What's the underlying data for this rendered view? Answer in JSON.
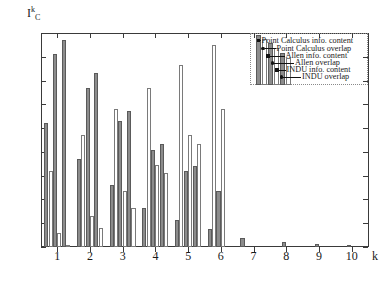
{
  "chart_data": {
    "type": "bar",
    "title": "",
    "subtitle": "",
    "xlabel": "k",
    "ylabel": "I",
    "ylabel_sup": "k",
    "ylabel_sub": "C",
    "categories": [
      "1",
      "2",
      "3",
      "4",
      "5",
      "6",
      "7",
      "8",
      "9",
      "10"
    ],
    "xlim": [
      0.5,
      10.5
    ],
    "ylim": [
      0,
      0.9
    ],
    "yticks": [
      "0",
      "0.1",
      "0.2",
      "0.3",
      "0.4",
      "0.5",
      "0.6",
      "0.7",
      "0.8",
      "0.9"
    ],
    "ytick_values": [
      0,
      0.1,
      0.2,
      0.3,
      0.4,
      0.5,
      0.6,
      0.7,
      0.8,
      0.9
    ],
    "grid": false,
    "legend_position": "upper right",
    "series": [
      {
        "name": "Point Calculus info. content",
        "style": "filled",
        "color": "#8c8c8c",
        "values": [
          0.52,
          0.37,
          0.26,
          0.165,
          0.115,
          0.075,
          0.04,
          0.0,
          0.0,
          0.0
        ]
      },
      {
        "name": "Point Calculus overlap",
        "style": "open",
        "color": "#ffffff",
        "values": [
          0.32,
          0.47,
          0.58,
          0.67,
          0.765,
          0.85,
          0.0,
          0.0,
          0.0,
          0.0
        ]
      },
      {
        "name": "Allen info. content",
        "style": "filled",
        "color": "#8c8c8c",
        "values": [
          0.81,
          0.67,
          0.53,
          0.41,
          0.32,
          0.235,
          0.0,
          0.02,
          0.012,
          0.008
        ]
      },
      {
        "name": "Allen overlap",
        "style": "open",
        "color": "#ffffff",
        "values": [
          0.06,
          0.13,
          0.235,
          0.345,
          0.47,
          0.58,
          0.0,
          0.0,
          0.0,
          0.0
        ]
      },
      {
        "name": "INDU info. content",
        "style": "filled",
        "color": "#8c8c8c",
        "values": [
          0.87,
          0.73,
          0.57,
          0.435,
          0.34,
          0.0,
          0.0,
          0.0,
          0.0,
          0.0
        ]
      },
      {
        "name": "INDU overlap",
        "style": "open",
        "color": "#ffffff",
        "values": [
          0.01,
          0.08,
          0.165,
          0.31,
          0.435,
          0.0,
          0.0,
          0.0,
          0.0,
          0.0
        ]
      }
    ]
  },
  "legend": {
    "entries": [
      {
        "label": "Point Calculus info. content",
        "marker": "sq"
      },
      {
        "label": "Point Calculus overlap",
        "marker": "dot"
      },
      {
        "label": "Allen info. content",
        "marker": "sq"
      },
      {
        "label": "Allen overlap",
        "marker": "dot"
      },
      {
        "label": "INDU info. content",
        "marker": "sq"
      },
      {
        "label": "INDU overlap",
        "marker": "dot"
      }
    ]
  }
}
